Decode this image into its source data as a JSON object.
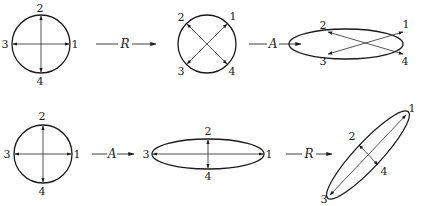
{
  "diagram": {
    "rows": [
      {
        "name": "row-rotate-then-stretch",
        "stages": [
          {
            "shape": "circle",
            "labels": [
              "1",
              "2",
              "3",
              "4"
            ]
          },
          {
            "operator": "R"
          },
          {
            "shape": "circle-rotated",
            "labels": [
              "1",
              "2",
              "3",
              "4"
            ]
          },
          {
            "operator": "A"
          },
          {
            "shape": "ellipse-horizontal",
            "labels": [
              "1",
              "2",
              "3",
              "4"
            ]
          }
        ]
      },
      {
        "name": "row-stretch-then-rotate",
        "stages": [
          {
            "shape": "circle",
            "labels": [
              "1",
              "2",
              "3",
              "4"
            ]
          },
          {
            "operator": "A"
          },
          {
            "shape": "ellipse-horizontal",
            "labels": [
              "1",
              "2",
              "3",
              "4"
            ]
          },
          {
            "operator": "R"
          },
          {
            "shape": "ellipse-rotated",
            "labels": [
              "1",
              "2",
              "3",
              "4"
            ]
          }
        ]
      }
    ],
    "operators": {
      "rotation": "R",
      "stretch": "A"
    },
    "point_labels": {
      "p1": "1",
      "p2": "2",
      "p3": "3",
      "p4": "4"
    }
  }
}
